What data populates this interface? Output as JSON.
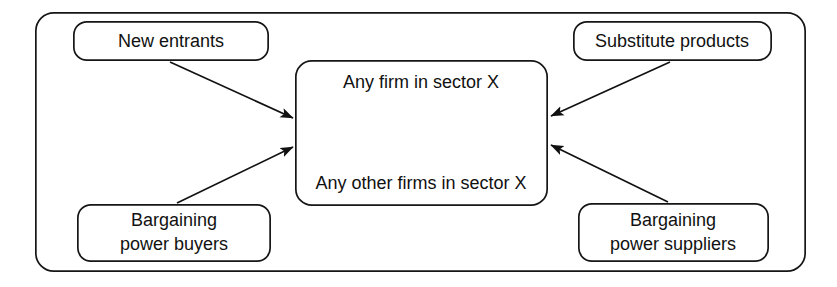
{
  "diagram": {
    "background_color": "#ffffff",
    "stroke_color": "#161616",
    "text_color": "#111111",
    "outer_container": {
      "label": "outer-frame",
      "x": 35,
      "y": 12,
      "width": 771,
      "height": 260,
      "corner_radius": 18
    },
    "nodes": [
      {
        "id": "new-entrants",
        "lines": [
          "New entrants"
        ],
        "x": 73,
        "y": 21,
        "width": 196,
        "height": 40,
        "corner_radius": 13
      },
      {
        "id": "substitute-products",
        "lines": [
          "Substitute products"
        ],
        "x": 573,
        "y": 21,
        "width": 199,
        "height": 40,
        "corner_radius": 13
      },
      {
        "id": "bargaining-power-buyers",
        "lines": [
          "Bargaining",
          "power buyers"
        ],
        "x": 77,
        "y": 204,
        "width": 194,
        "height": 58,
        "corner_radius": 13
      },
      {
        "id": "bargaining-power-suppliers",
        "lines": [
          "Bargaining",
          "power suppliers"
        ],
        "x": 578,
        "y": 203,
        "width": 191,
        "height": 59,
        "corner_radius": 13
      },
      {
        "id": "central-firms",
        "lines": [
          "Any firm in sector X",
          "Any other firms in sector X"
        ],
        "x": 295,
        "y": 60,
        "width": 253,
        "height": 146,
        "corner_radius": 16
      }
    ],
    "arrows": [
      {
        "id": "new-entrants-to-center",
        "from": "new-entrants",
        "to": "central-firms",
        "heads": "end",
        "x1": 170,
        "y1": 62,
        "x2": 293,
        "y2": 118
      },
      {
        "id": "substitute-products-to-center",
        "from": "substitute-products",
        "to": "central-firms",
        "heads": "end",
        "x1": 670,
        "y1": 62,
        "x2": 551,
        "y2": 116
      },
      {
        "id": "buyers-to-center",
        "from": "bargaining-power-buyers",
        "to": "central-firms",
        "heads": "end",
        "x1": 177,
        "y1": 203,
        "x2": 293,
        "y2": 147
      },
      {
        "id": "suppliers-to-center",
        "from": "bargaining-power-suppliers",
        "to": "central-firms",
        "heads": "end",
        "x1": 668,
        "y1": 202,
        "x2": 551,
        "y2": 145
      },
      {
        "id": "internal-rivalry",
        "from": "central-firms-top",
        "to": "central-firms-bottom",
        "heads": "both",
        "x1": 423,
        "y1": 95,
        "x2": 423,
        "y2": 173
      }
    ]
  }
}
